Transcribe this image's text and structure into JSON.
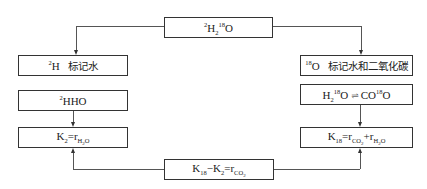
{
  "diagram": {
    "top_box": {
      "sup1": "2",
      "base1": "H",
      "sub1": "2",
      "sup2": "18",
      "base2": "O"
    },
    "left_column": {
      "label_box": {
        "sup": "2",
        "base": "H",
        "text": "标记水"
      },
      "species_box": {
        "sup": "2",
        "base": "HHO"
      },
      "formula_box": {
        "lhs": "K",
        "lhs_sub": "2",
        "eq": "=",
        "rhs": "r",
        "rhs_sub": "H",
        "rhs_sub2": "2",
        "rhs_sub3": "O"
      }
    },
    "right_column": {
      "label_box": {
        "sup": "18",
        "base": "O",
        "text": "标记水和二氧化碳"
      },
      "species_box": {
        "left_base": "H",
        "left_sub": "2",
        "left_sup": "18",
        "left_o": "O",
        "arrows": "⇌",
        "right_base": "CO",
        "right_sup": "18",
        "right_o": "O"
      },
      "formula_box": {
        "lhs": "K",
        "lhs_sub": "18",
        "eq": "=",
        "r1": "r",
        "r1_sub": "CO",
        "r1_sub2": "2",
        "plus": "+",
        "r2": "r",
        "r2_sub": "H",
        "r2_sub2": "2",
        "r2_sub3": "O"
      }
    },
    "bottom_box": {
      "k1": "K",
      "k1_sub": "18",
      "minus": "−",
      "k2": "K",
      "k2_sub": "2",
      "eq": "=",
      "r": "r",
      "r_sub": "CO",
      "r_sub2": "2"
    },
    "colors": {
      "line": "#555555",
      "border": "#333333",
      "background": "#ffffff"
    }
  }
}
